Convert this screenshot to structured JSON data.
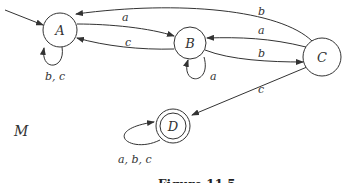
{
  "diagram": {
    "machine_label": "M",
    "caption": "Figure 11.5",
    "start_state": "A",
    "states": [
      {
        "id": "A",
        "label": "A",
        "accepting": false
      },
      {
        "id": "B",
        "label": "B",
        "accepting": false
      },
      {
        "id": "C",
        "label": "C",
        "accepting": false
      },
      {
        "id": "D",
        "label": "D",
        "accepting": true
      }
    ],
    "transitions": [
      {
        "from": "A",
        "to": "A",
        "label": "b, c"
      },
      {
        "from": "A",
        "to": "B",
        "label": "a"
      },
      {
        "from": "B",
        "to": "A",
        "label": "c"
      },
      {
        "from": "C",
        "to": "A",
        "label": "b"
      },
      {
        "from": "B",
        "to": "B",
        "label": "a"
      },
      {
        "from": "B",
        "to": "C",
        "label": "b"
      },
      {
        "from": "C",
        "to": "B",
        "label": "a"
      },
      {
        "from": "C",
        "to": "D",
        "label": "c"
      },
      {
        "from": "D",
        "to": "D",
        "label": "a, b, c"
      }
    ]
  }
}
